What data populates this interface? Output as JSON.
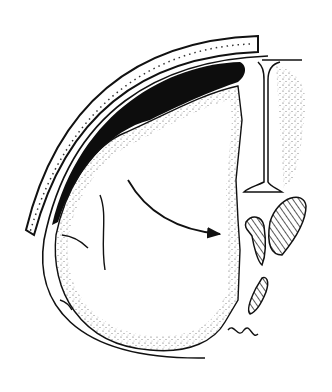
{
  "figure": {
    "colors": {
      "background": "#ffffff",
      "ink": "#111111",
      "hematoma": "#0d0d0d",
      "stipple": "#555555"
    },
    "elements": [
      "skull",
      "hematoma",
      "falx",
      "brain-hemisphere",
      "ventricles",
      "shift-arrow"
    ]
  }
}
